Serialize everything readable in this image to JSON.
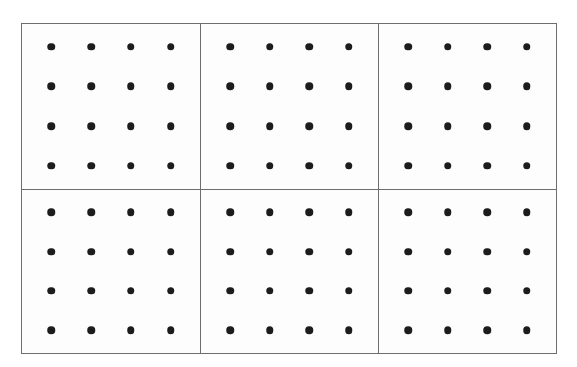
{
  "figure": {
    "background_color": "#ffffff",
    "cell_background_color": "#fdfdfd",
    "border_color": "#6e6e6e",
    "dot_color": "#1c1c1c",
    "border_width_px": 1,
    "dot_diameter_px": 7.5
  },
  "chart_data": {
    "type": "scatter",
    "title": "",
    "subtitle": "",
    "xlabel": "",
    "ylabel": "",
    "grid": true,
    "legend": null,
    "tick_labels_x": [],
    "tick_labels_y": [],
    "panel_layout": {
      "rows": 2,
      "cols": 3,
      "total_panels": 6
    },
    "points_per_panel": {
      "rows": 4,
      "cols": 4,
      "count": 16
    },
    "total_points": 96,
    "panels": [
      {
        "name": "panel-top-left",
        "row": 0,
        "col": 0,
        "x": [
          1,
          2,
          3,
          4
        ],
        "y": [
          1,
          2,
          3,
          4
        ],
        "values": [
          [
            1,
            1
          ],
          [
            2,
            1
          ],
          [
            3,
            1
          ],
          [
            4,
            1
          ],
          [
            1,
            2
          ],
          [
            2,
            2
          ],
          [
            3,
            2
          ],
          [
            4,
            2
          ],
          [
            1,
            3
          ],
          [
            2,
            3
          ],
          [
            3,
            3
          ],
          [
            4,
            3
          ],
          [
            1,
            4
          ],
          [
            2,
            4
          ],
          [
            3,
            4
          ],
          [
            4,
            4
          ]
        ]
      },
      {
        "name": "panel-top-center",
        "row": 0,
        "col": 1,
        "x": [
          1,
          2,
          3,
          4
        ],
        "y": [
          1,
          2,
          3,
          4
        ],
        "values": [
          [
            1,
            1
          ],
          [
            2,
            1
          ],
          [
            3,
            1
          ],
          [
            4,
            1
          ],
          [
            1,
            2
          ],
          [
            2,
            2
          ],
          [
            3,
            2
          ],
          [
            4,
            2
          ],
          [
            1,
            3
          ],
          [
            2,
            3
          ],
          [
            3,
            3
          ],
          [
            4,
            3
          ],
          [
            1,
            4
          ],
          [
            2,
            4
          ],
          [
            3,
            4
          ],
          [
            4,
            4
          ]
        ]
      },
      {
        "name": "panel-top-right",
        "row": 0,
        "col": 2,
        "x": [
          1,
          2,
          3,
          4
        ],
        "y": [
          1,
          2,
          3,
          4
        ],
        "values": [
          [
            1,
            1
          ],
          [
            2,
            1
          ],
          [
            3,
            1
          ],
          [
            4,
            1
          ],
          [
            1,
            2
          ],
          [
            2,
            2
          ],
          [
            3,
            2
          ],
          [
            4,
            2
          ],
          [
            1,
            3
          ],
          [
            2,
            3
          ],
          [
            3,
            3
          ],
          [
            4,
            3
          ],
          [
            1,
            4
          ],
          [
            2,
            4
          ],
          [
            3,
            4
          ],
          [
            4,
            4
          ]
        ]
      },
      {
        "name": "panel-bottom-left",
        "row": 1,
        "col": 0,
        "x": [
          1,
          2,
          3,
          4
        ],
        "y": [
          1,
          2,
          3,
          4
        ],
        "values": [
          [
            1,
            1
          ],
          [
            2,
            1
          ],
          [
            3,
            1
          ],
          [
            4,
            1
          ],
          [
            1,
            2
          ],
          [
            2,
            2
          ],
          [
            3,
            2
          ],
          [
            4,
            2
          ],
          [
            1,
            3
          ],
          [
            2,
            3
          ],
          [
            3,
            3
          ],
          [
            4,
            3
          ],
          [
            1,
            4
          ],
          [
            2,
            4
          ],
          [
            3,
            4
          ],
          [
            4,
            4
          ]
        ]
      },
      {
        "name": "panel-bottom-center",
        "row": 1,
        "col": 1,
        "x": [
          1,
          2,
          3,
          4
        ],
        "y": [
          1,
          2,
          3,
          4
        ],
        "values": [
          [
            1,
            1
          ],
          [
            2,
            1
          ],
          [
            3,
            1
          ],
          [
            4,
            1
          ],
          [
            1,
            2
          ],
          [
            2,
            2
          ],
          [
            3,
            2
          ],
          [
            4,
            2
          ],
          [
            1,
            3
          ],
          [
            2,
            3
          ],
          [
            3,
            3
          ],
          [
            4,
            3
          ],
          [
            1,
            4
          ],
          [
            2,
            4
          ],
          [
            3,
            4
          ],
          [
            4,
            4
          ]
        ]
      },
      {
        "name": "panel-bottom-right",
        "row": 1,
        "col": 2,
        "x": [
          1,
          2,
          3,
          4
        ],
        "y": [
          1,
          2,
          3,
          4
        ],
        "values": [
          [
            1,
            1
          ],
          [
            2,
            1
          ],
          [
            3,
            1
          ],
          [
            4,
            1
          ],
          [
            1,
            2
          ],
          [
            2,
            2
          ],
          [
            3,
            2
          ],
          [
            4,
            2
          ],
          [
            1,
            3
          ],
          [
            2,
            3
          ],
          [
            3,
            3
          ],
          [
            4,
            3
          ],
          [
            1,
            4
          ],
          [
            2,
            4
          ],
          [
            3,
            4
          ],
          [
            4,
            4
          ]
        ]
      }
    ]
  },
  "geometry": {
    "frame_left": 21,
    "frame_top": 23,
    "frame_width": 536,
    "frame_height": 331,
    "dot_inset_x_ratio": 0.165,
    "dot_step_x_ratio": 0.2233,
    "dot_inset_y_ratio": 0.139,
    "dot_step_y_ratio": 0.2407
  }
}
